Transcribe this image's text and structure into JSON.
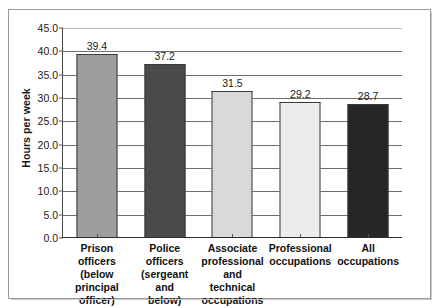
{
  "chart_data": {
    "type": "bar",
    "title": "",
    "subtitle": "",
    "xlabel": "",
    "ylabel": "Hours per week",
    "ylim": [
      0.0,
      45.0
    ],
    "ytick_step": 5.0,
    "yticks": [
      "45.0",
      "40.0",
      "35.0",
      "30.0",
      "25.0",
      "20.0",
      "15.0",
      "10.0",
      "5.0",
      "0.0"
    ],
    "grid": true,
    "grid_axis": "y",
    "legend": false,
    "legend_position": "none",
    "categories": [
      "Prison officers (below principal officer)",
      "Police officers (sergeant and below)",
      "Associate professional and technical occupations",
      "Professional occupations",
      "All occupations"
    ],
    "category_lines": [
      [
        "Prison officers",
        "(below",
        "principal",
        "officer)"
      ],
      [
        "Police officers",
        "(sergeant and",
        "below)"
      ],
      [
        "Associate",
        "professional",
        "and technical",
        "occupations"
      ],
      [
        "Professional",
        "occupations"
      ],
      [
        "All occupations"
      ]
    ],
    "values": [
      39.4,
      37.2,
      31.5,
      29.2,
      28.7
    ],
    "data_labels": [
      "39.4",
      "37.2",
      "31.5",
      "29.2",
      "28.7"
    ],
    "bar_colors": [
      "#9e9e9e",
      "#4a4a4a",
      "#d9d9d9",
      "#ececec",
      "#262626"
    ],
    "bar_border_color": "#3a3a3a",
    "gridline_color": "#6e6e6e",
    "axis_color": "#2e2e2e",
    "frame_border_color": "#9a9a9a",
    "background_color": "#ffffff",
    "text_color": "#1a1a1a"
  }
}
